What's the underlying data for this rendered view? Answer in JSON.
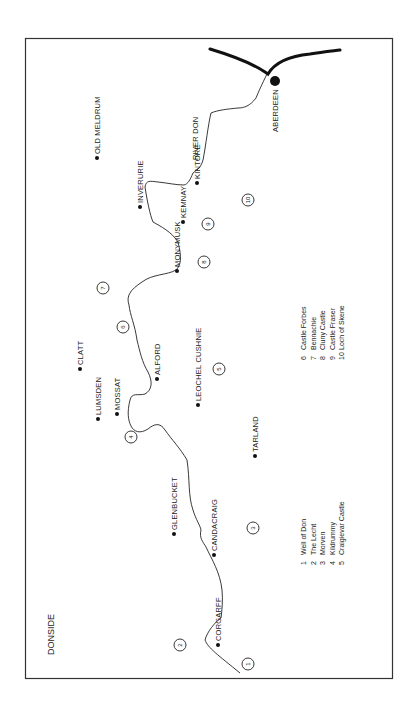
{
  "map": {
    "title": "DONSIDE",
    "river_label": "RIVER DON",
    "towns": [
      {
        "name": "ABERDEEN",
        "x": 275,
        "y": 81,
        "major": true
      },
      {
        "name": "OLD MELDRUM",
        "x": 97,
        "y": 158
      },
      {
        "name": "INVERURIE",
        "x": 140,
        "y": 207
      },
      {
        "name": "KINTORE",
        "x": 197,
        "y": 183
      },
      {
        "name": "KEMNAY",
        "x": 183,
        "y": 222
      },
      {
        "name": "MONYMUSK",
        "x": 177,
        "y": 271
      },
      {
        "name": "CLATT",
        "x": 80,
        "y": 369
      },
      {
        "name": "LUMSDEN",
        "x": 98,
        "y": 419
      },
      {
        "name": "MOSSAT",
        "x": 117,
        "y": 414
      },
      {
        "name": "ALFORD",
        "x": 157,
        "y": 379
      },
      {
        "name": "LEOCHEL CUSHNIE",
        "x": 198,
        "y": 405
      },
      {
        "name": "TARLAND",
        "x": 255,
        "y": 456
      },
      {
        "name": "GLENBUCKET",
        "x": 174,
        "y": 534
      },
      {
        "name": "CANDACRAIG",
        "x": 214,
        "y": 555
      },
      {
        "name": "CORGARFF",
        "x": 218,
        "y": 645
      }
    ],
    "sites": [
      {
        "num": "1",
        "x": 248,
        "y": 664
      },
      {
        "num": "2",
        "x": 180,
        "y": 645
      },
      {
        "num": "3",
        "x": 253,
        "y": 528
      },
      {
        "num": "4",
        "x": 131,
        "y": 437
      },
      {
        "num": "5",
        "x": 219,
        "y": 369
      },
      {
        "num": "6",
        "x": 123,
        "y": 327
      },
      {
        "num": "7",
        "x": 103,
        "y": 288
      },
      {
        "num": "8",
        "x": 204,
        "y": 262
      },
      {
        "num": "9",
        "x": 208,
        "y": 224
      },
      {
        "num": "10",
        "x": 248,
        "y": 200
      }
    ],
    "legend_left": [
      {
        "num": "1",
        "label": "Well of Don"
      },
      {
        "num": "2",
        "label": "The Lecht"
      },
      {
        "num": "3",
        "label": "Morven"
      },
      {
        "num": "4",
        "label": "Kildrummy"
      },
      {
        "num": "5",
        "label": "Craigievar Castle"
      }
    ],
    "legend_right": [
      {
        "num": "6",
        "label": "Castle Forbes"
      },
      {
        "num": "7",
        "label": "Bennachie"
      },
      {
        "num": "8",
        "label": "Cluny Castle"
      },
      {
        "num": "9",
        "label": "Castle Fraser"
      },
      {
        "num": "10",
        "label": "Loch of Skene"
      }
    ],
    "colors": {
      "ink": "#222222",
      "paper": "#ffffff"
    }
  }
}
